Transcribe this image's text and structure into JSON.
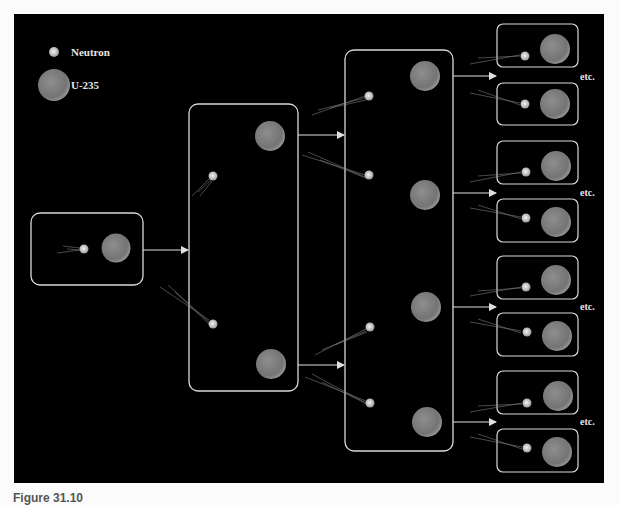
{
  "legend": {
    "neutron_label": "Neutron",
    "u235_label": "U-235"
  },
  "etc_label": "etc.",
  "caption": "Figure 31.10",
  "colors": {
    "background": "#000000",
    "box_stroke": "#d9d9d9",
    "nucleus_fill": "#7a7a7a",
    "neutron_fill": "#cfcfcf",
    "arrow": "#e0e0e0"
  },
  "diagram": {
    "stages": [
      {
        "id": "stage-1",
        "nuclei": 1,
        "neutrons": 1
      },
      {
        "id": "stage-2",
        "nuclei": 2,
        "neutrons": 2
      },
      {
        "id": "stage-3",
        "nuclei": 4,
        "neutrons": 4
      },
      {
        "id": "stage-4",
        "boxes": 8,
        "note": "etc."
      }
    ]
  }
}
